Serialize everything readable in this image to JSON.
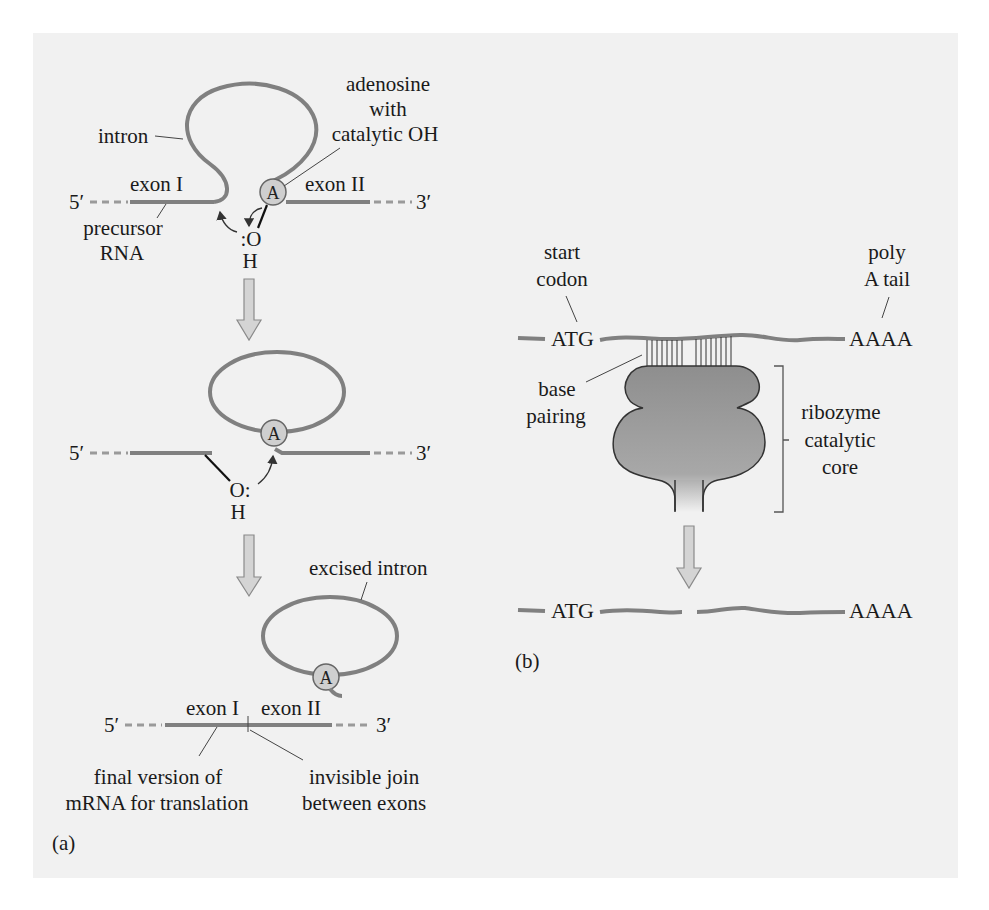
{
  "figure": {
    "panel_a": {
      "label": "(a)",
      "step1": {
        "intron_label": "intron",
        "adenosine_label_line1": "adenosine",
        "adenosine_label_line2": "with",
        "adenosine_label_line3": "catalytic OH",
        "exon1_label": "exon I",
        "exon2_label": "exon II",
        "five_prime": "5′",
        "three_prime": "3′",
        "precursor_line1": "precursor",
        "precursor_line2": "RNA",
        "oh_o": ":O",
        "oh_h": "H",
        "adenosine_glyph": "A"
      },
      "step2": {
        "five_prime": "5′",
        "three_prime": "3′",
        "oh_o": "O:",
        "oh_h": "H",
        "adenosine_glyph": "A"
      },
      "step3": {
        "excised_intron_label": "excised intron",
        "exon1_label": "exon I",
        "exon2_label": "exon II",
        "five_prime": "5′",
        "three_prime": "3′",
        "final_mrna_line1": "final version of",
        "final_mrna_line2": "mRNA for translation",
        "join_line1": "invisible join",
        "join_line2": "between exons",
        "adenosine_glyph": "A"
      }
    },
    "panel_b": {
      "label": "(b)",
      "start_codon_line1": "start",
      "start_codon_line2": "codon",
      "poly_a_line1": "poly",
      "poly_a_line2": "A tail",
      "atg": "ATG",
      "aaaa": "AAAA",
      "base_pairing_line1": "base",
      "base_pairing_line2": "pairing",
      "ribozyme_line1": "ribozyme",
      "ribozyme_line2": "catalytic",
      "ribozyme_line3": "core",
      "product_atg": "ATG",
      "product_aaaa": "AAAA"
    },
    "colors": {
      "panel_background": "#f1f1f1",
      "rna_strand": "#808080",
      "adenosine_fill": "#cfcfcf",
      "arrow_fill": "#d4d4d4",
      "ribozyme_fill": "#9a9a9a"
    }
  }
}
